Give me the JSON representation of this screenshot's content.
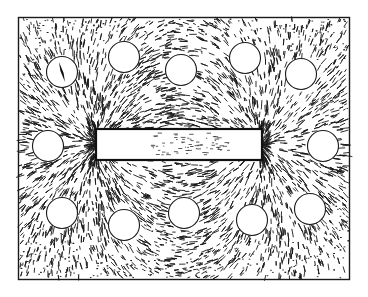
{
  "figure": {
    "title": "Iron filings pattern around a bar magnet with compasses",
    "background_color": "#ffffff",
    "ink_color": "#1a1a1a"
  },
  "magnet": {
    "label": "bar magnet",
    "poles": [
      "left-pole",
      "right-pole"
    ]
  },
  "compasses": [
    {
      "id": "compass-1",
      "row": "top",
      "has_needle": true
    },
    {
      "id": "compass-2",
      "row": "top",
      "has_needle": false
    },
    {
      "id": "compass-3",
      "row": "top",
      "has_needle": false
    },
    {
      "id": "compass-4",
      "row": "top",
      "has_needle": false
    },
    {
      "id": "compass-5",
      "row": "top",
      "has_needle": false
    },
    {
      "id": "compass-6",
      "row": "middle",
      "has_needle": false
    },
    {
      "id": "compass-7",
      "row": "middle",
      "has_needle": false
    },
    {
      "id": "compass-8",
      "row": "bottom",
      "has_needle": false
    },
    {
      "id": "compass-9",
      "row": "bottom",
      "has_needle": false
    },
    {
      "id": "compass-10",
      "row": "bottom",
      "has_needle": false
    },
    {
      "id": "compass-11",
      "row": "bottom",
      "has_needle": false
    },
    {
      "id": "compass-12",
      "row": "bottom",
      "has_needle": false
    }
  ]
}
